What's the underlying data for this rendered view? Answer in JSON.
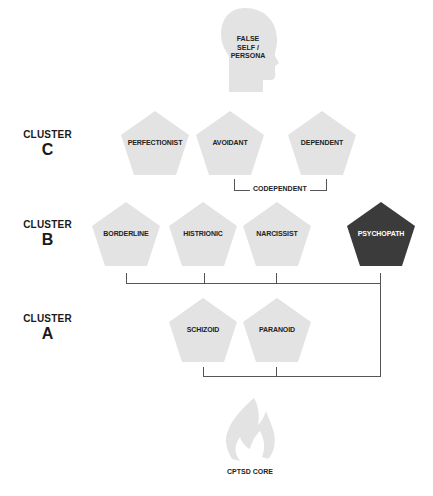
{
  "head": {
    "label_lines": [
      "FALSE",
      "SELF /",
      "PERSONA"
    ]
  },
  "clusters": [
    {
      "word": "CLUSTER",
      "letter": "C"
    },
    {
      "word": "CLUSTER",
      "letter": "B"
    },
    {
      "word": "CLUSTER",
      "letter": "A"
    }
  ],
  "cluster_c": [
    {
      "label": "PERFECTIONIST"
    },
    {
      "label": "AVOIDANT"
    },
    {
      "label": "DEPENDENT"
    }
  ],
  "codependent": {
    "label": "CODEPENDENT"
  },
  "cluster_b": [
    {
      "label": "BORDERLINE"
    },
    {
      "label": "HISTRIONIC"
    },
    {
      "label": "NARCISSIST"
    },
    {
      "label": "PSYCHOPATH"
    }
  ],
  "cluster_a": [
    {
      "label": "SCHIZOID"
    },
    {
      "label": "PARANOID"
    }
  ],
  "core": {
    "label": "CPTSD CORE"
  },
  "colors": {
    "pentagon": "#e3e3e3",
    "pentagon_dark": "#3b3b3b",
    "line": "#555555"
  }
}
